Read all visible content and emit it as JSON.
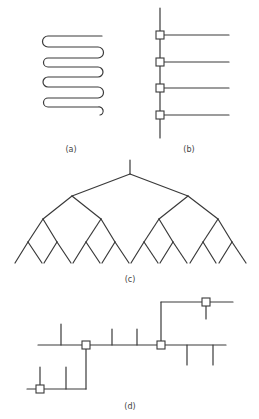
{
  "figure": {
    "panels": [
      {
        "id": "a",
        "label": "(a)",
        "description": "Serpentine (meander) line"
      },
      {
        "id": "b",
        "label": "(b)",
        "description": "Vertical bus with four boxed taps branching right"
      },
      {
        "id": "c",
        "label": "(c)",
        "description": "Binary tree, four levels, 16 leaves"
      },
      {
        "id": "d",
        "label": "(d)",
        "description": "Stepped bus with boxed junctions and stub branches"
      }
    ]
  },
  "labels": {
    "a": "(a)",
    "b": "(b)",
    "c": "(c)",
    "d": "(d)"
  },
  "colors": {
    "line": "#3a3a3a",
    "background": "#ffffff"
  }
}
